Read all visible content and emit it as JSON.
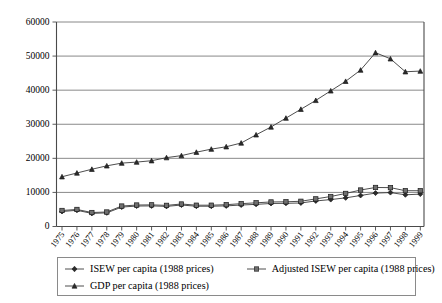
{
  "chart_data": {
    "type": "line",
    "title": "",
    "xlabel": "",
    "ylabel": "",
    "ylim": [
      0,
      60000
    ],
    "ytick_labels": [
      "0",
      "10000",
      "20000",
      "30000",
      "40000",
      "50000",
      "60000"
    ],
    "yticks": [
      0,
      10000,
      20000,
      30000,
      40000,
      50000,
      60000
    ],
    "grid": true,
    "legend_position": "bottom",
    "categories": [
      "1975",
      "1976",
      "1977",
      "1978",
      "1979",
      "1980",
      "1981",
      "1982",
      "1983",
      "1984",
      "1985",
      "1986",
      "1987",
      "1988",
      "1989",
      "1990",
      "1991",
      "1992",
      "1993",
      "1994",
      "1995",
      "1996",
      "1997",
      "1998",
      "1999"
    ],
    "series": [
      {
        "name": "ISEW per capita (1988 prices)",
        "marker": "diamond",
        "color": "#2b2b2b",
        "values": [
          4400,
          4750,
          3850,
          4000,
          5700,
          6000,
          6050,
          5900,
          6300,
          5950,
          5950,
          6050,
          6300,
          6500,
          6750,
          6800,
          6900,
          7500,
          7900,
          8400,
          9100,
          9800,
          9950,
          9300,
          9500
        ]
      },
      {
        "name": "Adjusted ISEW per capita (1988 prices)",
        "marker": "square",
        "color": "#6f6f6f",
        "values": [
          4700,
          5000,
          4100,
          4250,
          6000,
          6300,
          6350,
          6200,
          6600,
          6250,
          6250,
          6400,
          6700,
          6950,
          7200,
          7250,
          7400,
          8100,
          8800,
          9700,
          10700,
          11450,
          11400,
          10500,
          10500
        ]
      },
      {
        "name": "GDP per capita (1988 prices)",
        "marker": "triangle",
        "color": "#2b2b2b",
        "values": [
          14600,
          15700,
          16800,
          17800,
          18600,
          18900,
          19300,
          20200,
          20800,
          21800,
          22700,
          23400,
          24500,
          26900,
          29200,
          31800,
          34400,
          37000,
          39800,
          42600,
          45900,
          51000,
          49200,
          45400,
          45600
        ]
      }
    ]
  },
  "legend": {
    "entries": [
      {
        "label": "ISEW per capita (1988 prices)"
      },
      {
        "label": "Adjusted ISEW per capita (1988 prices)"
      },
      {
        "label": "GDP per capita (1988 prices)"
      }
    ]
  }
}
